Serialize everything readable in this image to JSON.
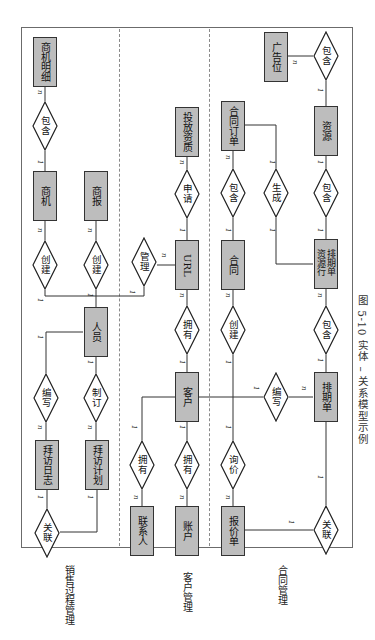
{
  "diagram": {
    "caption": "图 5-10   实体 – 关系模型示例",
    "sections": [
      {
        "id": "sales",
        "label": "销售过程管理"
      },
      {
        "id": "customer",
        "label": "客户管理"
      },
      {
        "id": "contract",
        "label": "合同管理"
      }
    ],
    "entities": {
      "biz_detail": "商机明细",
      "biz_opportunity": "商机",
      "biz_report": "商报",
      "staff": "人员",
      "visit_log": "拜访日志",
      "visit_plan": "拜访计划",
      "ad_qualification": "投放资质",
      "url": "URL",
      "customer": "客户",
      "contact": "联系人",
      "account": "账户",
      "contract_order": "合同订单",
      "contract": "合同",
      "schedule_resource_line": "排期单资源行",
      "schedule": "排期单",
      "quote": "报价单",
      "ad_slot": "广告位",
      "resource": "资源"
    },
    "relationships": {
      "contains_detail": "包含",
      "create_opportunity": "创建",
      "create_report": "创建",
      "manage": "管理",
      "apply": "申请",
      "contains_order": "包含",
      "generate": "生成",
      "contains_resource": "包含",
      "contains_slot": "包含",
      "write_log": "编写",
      "make_plan": "制订",
      "own_url": "拥有",
      "create_contract": "创建",
      "contains_schedule_line": "包含",
      "write_schedule": "编写",
      "associate_visit": "关联",
      "own_contact": "拥有",
      "own_account": "拥有",
      "inquire": "询价",
      "associate_quote": "关联"
    },
    "cardinality": {
      "one": "1",
      "many": "n"
    }
  }
}
